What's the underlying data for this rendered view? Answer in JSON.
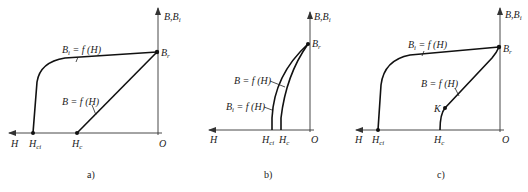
{
  "figure": {
    "panels": [
      {
        "id": "a",
        "caption": "a)",
        "y_axis_label": "B,B",
        "y_axis_label_sub": "i",
        "x_axis_label": "H",
        "origin_label": "O",
        "points": {
          "br": {
            "label": "B",
            "sub": "r"
          },
          "hci": {
            "label": "H",
            "sub": "ci"
          },
          "hc": {
            "label": "H",
            "sub": "c"
          }
        },
        "curves": [
          {
            "name": "intrinsic",
            "label": "B",
            "label_sub": "i",
            "label_rest": " = f (H)"
          },
          {
            "name": "normal",
            "label": "B = f (H)"
          }
        ]
      },
      {
        "id": "b",
        "caption": "b)",
        "y_axis_label": "B,B",
        "y_axis_label_sub": "i",
        "x_axis_label": "H",
        "origin_label": "O",
        "points": {
          "br": {
            "label": "B",
            "sub": "r"
          },
          "hci": {
            "label": "H",
            "sub": "ci"
          },
          "hc": {
            "label": "H",
            "sub": "c"
          }
        },
        "curves": [
          {
            "name": "normal",
            "label": "B = f (H)"
          },
          {
            "name": "intrinsic",
            "label": "B",
            "label_sub": "i",
            "label_rest": " = f (H)"
          }
        ]
      },
      {
        "id": "c",
        "caption": "c)",
        "y_axis_label": "B,B",
        "y_axis_label_sub": "i",
        "x_axis_label": "H",
        "origin_label": "O",
        "points": {
          "br": {
            "label": "B",
            "sub": "r"
          },
          "hci": {
            "label": "H",
            "sub": "ci"
          },
          "hc": {
            "label": "H",
            "sub": "c"
          },
          "k": {
            "label": "K"
          }
        },
        "curves": [
          {
            "name": "intrinsic",
            "label": "B",
            "label_sub": "i",
            "label_rest": " = f (H)"
          },
          {
            "name": "normal",
            "label": "B = f (H)"
          }
        ]
      }
    ]
  }
}
